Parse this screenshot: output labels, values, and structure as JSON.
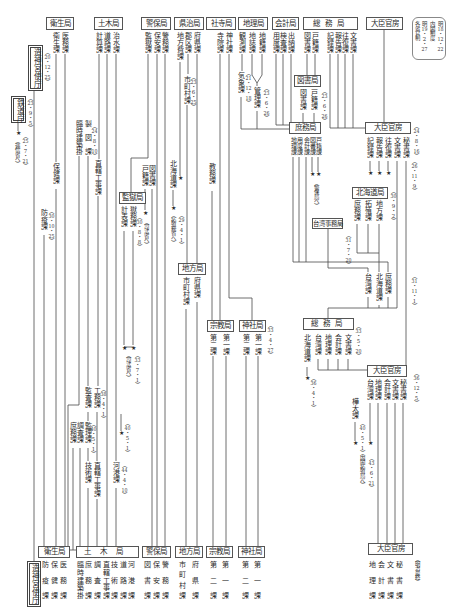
{
  "symbols": {
    "star": "★"
  },
  "note": [
    "明18・12・22",
    "内閣制度",
    "明19・2・27",
    "各省官制"
  ],
  "top": {
    "eisei": {
      "name": "衛生局",
      "sections": [
        "医務課",
        "衛生課"
      ]
    },
    "doboku": {
      "name": "土木局",
      "sections": [
        "治水課",
        "道路課",
        "計算課"
      ]
    },
    "keiho": {
      "name": "警保局",
      "sections": [
        "警務課",
        "保安課",
        "監獄課"
      ]
    },
    "kenji": {
      "name": "県治局",
      "sections": [
        "府県課",
        "郡区課",
        "地方費課"
      ]
    },
    "shaji": {
      "name": "社寺局",
      "sections": [
        "神社課",
        "寺院課"
      ]
    },
    "chiri": {
      "name": "地理局",
      "sections": [
        "地籍課",
        "地誌課",
        "観測課"
      ]
    },
    "kaikei": {
      "name": "会計局",
      "sections": [
        "出納課",
        "検査課",
        "用度課"
      ]
    },
    "somu": {
      "name": "総務局",
      "sections": [
        "文書課",
        "往復課",
        "報告課",
        "記録課",
        "戸籍課",
        "図書課"
      ]
    },
    "kanbo": {
      "name": "大臣官房"
    }
  },
  "zojingu": {
    "name": "造神宮使庁",
    "date": "（20・12・25）"
  },
  "tetsudo": {
    "name": "鉄道庁",
    "date": "（23・9・5）",
    "transfer_date": "（25・7・21）",
    "transfer": "（逓信省へ）"
  },
  "eisei_changes": {
    "hoken": "保健課",
    "boeki": "防疫課",
    "boeki_date": "（30・10・25）"
  },
  "doboku_changes": {
    "rinji": "臨時建築掛",
    "seizu": "製図課",
    "date_24": "（24・8・10）",
    "chokkatsu": "直轄工事課",
    "kansa": "監査課",
    "komu": "工務課",
    "date_38": "（38・4・1）",
    "shomu": "庶務課",
    "chosa": "調査課",
    "kanri": "監理課",
    "date_40": "（40・5・1）",
    "abolished_date": "（40・5・1）",
    "gijutsu": "技術課",
    "chokkatsu_2": "直轄工事課",
    "kako": "河港課",
    "date_44": "（44・4・10）"
  },
  "keiho_changes": {
    "tosho": "図書課",
    "koseki": "戸籍課",
    "koseki_date": "（30・8・8）",
    "koseki_transfer": "（司法省へ）"
  },
  "kangoku": {
    "name": "監獄局",
    "sections": [
      "計表課",
      "獄務課"
    ],
    "transfer_date": "（33・7・1）",
    "transfer": "（司法省へ）"
  },
  "kenji_changes": {
    "shichoson": "市町村課",
    "shichoson_date": "（23・6・25）",
    "hokkaido": "北海道課",
    "hokkaido_date": "（29・4・1）",
    "hokkaido_transfer": "（拓殖務省へ）"
  },
  "chiho_mid": {
    "name": "地方局",
    "sections": [
      "府県課",
      "市町村課"
    ]
  },
  "shaji_changes": {
    "kyomu": "教務課"
  },
  "shukyo_mid": {
    "name": "宗教局",
    "sections": [
      "第一課",
      "第二課"
    ]
  },
  "jinja_mid": {
    "name": "神社局",
    "sections": [
      "第一課",
      "第二課"
    ],
    "date": "（33・4・27）"
  },
  "chiri_changes": {
    "kisho": "気象課",
    "kisho_date": "（21・12・18）",
    "kanri": "管理課",
    "kanri_date": "（23・6・26）"
  },
  "toshokyoku": {
    "name": "図書局",
    "sections": [
      "図書課",
      "戸籍課"
    ],
    "date": "（23・6・26）"
  },
  "shomukyoku": {
    "name": "庶務局",
    "sections": [
      "戸籍課",
      "図書課",
      "会計課",
      "用度課",
      "地理課"
    ],
    "transfer": "（警保局へ）"
  },
  "kanbo_24": {
    "name": "大臣官房",
    "date": "（24・8・16）",
    "sections": [
      "秘書課",
      "文書課",
      "往復課",
      "報告課",
      "記録課"
    ],
    "date_26": "（26・11・9）",
    "date_31": "（31・11・1）"
  },
  "hokkaidokyoku": {
    "name": "北海道局",
    "date": "（30・9・2）",
    "sections": [
      "地方課",
      "拓殖課",
      "庶務課"
    ]
  },
  "taiwan_jimukyoku": {
    "name": "台湾事務局",
    "date": "（31・7・20）"
  },
  "merged_sections": [
    "庶務課",
    "北海道課",
    "台湾課"
  ],
  "somu_33": {
    "name": "総務局",
    "date": "（33・5・20）",
    "sections": [
      "文書課",
      "会計課",
      "地理課",
      "台湾課",
      "北海道課"
    ],
    "hokkaido_date": "（36・4・1）"
  },
  "kanbo_36": {
    "name": "大臣官房",
    "date": "（36・12・5）",
    "sections": [
      "秘書課",
      "文書課",
      "会計課",
      "地理課",
      "台湾課"
    ],
    "karafuto": "樺太課",
    "karafuto_date": "（40・5・1）",
    "transfer_date": "（43・6・21）",
    "transfer": "（内閣拓殖局へ）"
  },
  "bottom": {
    "eisei": {
      "name": "衛生局",
      "sections": [
        "医務課",
        "保健課",
        "防疫課"
      ]
    },
    "doboku": {
      "name": "土木局",
      "sections": [
        "河港課",
        "道路課",
        "技術課",
        "直轄工事課",
        "調査課",
        "庶務課",
        "臨時建築掛"
      ]
    },
    "keiho": {
      "name": "警保局",
      "sections": [
        "警務課",
        "保安課",
        "図書課"
      ]
    },
    "chiho": {
      "name": "地方局",
      "sections": [
        "府県課",
        "市町村課"
      ]
    },
    "shukyo": {
      "name": "宗教局",
      "sections": [
        "第一課",
        "第二課"
      ]
    },
    "jinja": {
      "name": "神社局",
      "sections": [
        "第一課",
        "第二課"
      ]
    },
    "kanbo": {
      "name": "大臣官房",
      "sections": [
        "秘書課",
        "文書課",
        "会計課",
        "地理課"
      ],
      "note": "（明治最終）"
    },
    "zojingu": {
      "name": "造神宮使庁"
    }
  }
}
